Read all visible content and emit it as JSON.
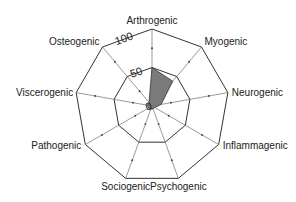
{
  "chart_data": {
    "type": "radar",
    "title": "",
    "axes": [
      "Arthrogenic",
      "Myogenic",
      "Neurogenic",
      "Inflammagenic",
      "Psychogenic",
      "Sociogenic",
      "Pathogenic",
      "Viscerogenic",
      "Osteogenic"
    ],
    "series": [
      {
        "name": "",
        "values": [
          50,
          42,
          12,
          4,
          4,
          4,
          5,
          6,
          6
        ],
        "color": "#7a7a7a"
      }
    ],
    "scale": {
      "min": 0,
      "max": 100,
      "rings": [
        50,
        100
      ],
      "ticks": [
        25,
        75
      ]
    },
    "scale_labels": [
      "0",
      "50",
      "100"
    ],
    "grid": true,
    "legend": "none"
  }
}
